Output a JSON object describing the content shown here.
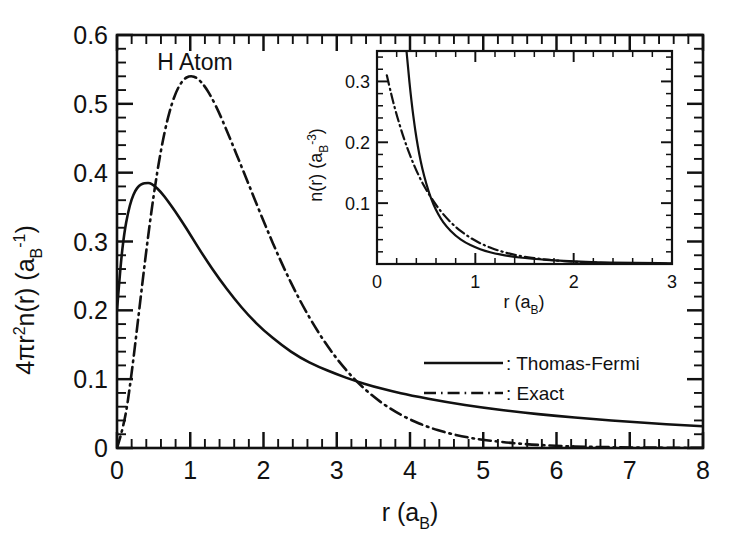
{
  "chart_data": [
    {
      "type": "line",
      "id": "main",
      "title": "",
      "annotation": "H Atom",
      "xlabel": "r  (a_B)",
      "xlabel_parts": {
        "symbol": "r",
        "open": "(a",
        "sub": "B",
        "close": ")"
      },
      "ylabel": "4πr²n(r)  (a_B⁻¹)",
      "ylabel_parts": {
        "main": "4πr",
        "exp1": "2",
        "mid": "n(r)",
        "open": "(a",
        "sub": "B",
        "sup": "-1",
        "close": ")"
      },
      "xlim": [
        0,
        8
      ],
      "ylim": [
        0,
        0.6
      ],
      "xticks": [
        0,
        1,
        2,
        3,
        4,
        5,
        6,
        7,
        8
      ],
      "xticklabels": [
        "0",
        "1",
        "2",
        "3",
        "4",
        "5",
        "6",
        "7",
        "8"
      ],
      "yticks": [
        0,
        0.1,
        0.2,
        0.3,
        0.4,
        0.5,
        0.6
      ],
      "yticklabels": [
        "0",
        "0.1",
        "0.2",
        "0.3",
        "0.4",
        "0.5",
        "0.6"
      ],
      "x_minor_per_major": 5,
      "y_minor_per_major": 5,
      "grid": false,
      "legend_position": "center-right-inside",
      "series": [
        {
          "name": "Thomas-Fermi",
          "style": "solid",
          "legend_label": ": Thomas-Fermi",
          "x": [
            0.0,
            0.05,
            0.1,
            0.15,
            0.2,
            0.25,
            0.3,
            0.35,
            0.4,
            0.45,
            0.5,
            0.6,
            0.7,
            0.8,
            0.9,
            1.0,
            1.2,
            1.4,
            1.6,
            1.8,
            2.0,
            2.25,
            2.5,
            2.75,
            3.0,
            3.25,
            3.5,
            3.75,
            4.0,
            4.5,
            5.0,
            5.5,
            6.0,
            6.5,
            7.0,
            7.5,
            8.0
          ],
          "y": [
            0.2,
            0.268,
            0.313,
            0.342,
            0.362,
            0.374,
            0.381,
            0.384,
            0.385,
            0.385,
            0.382,
            0.372,
            0.358,
            0.343,
            0.327,
            0.31,
            0.276,
            0.245,
            0.217,
            0.192,
            0.171,
            0.149,
            0.131,
            0.118,
            0.107,
            0.0975,
            0.0895,
            0.0825,
            0.0765,
            0.0665,
            0.0585,
            0.052,
            0.0465,
            0.042,
            0.038,
            0.0345,
            0.0315
          ]
        },
        {
          "name": "Exact",
          "style": "dashdot",
          "legend_label": ": Exact",
          "x": [
            0.0,
            0.1,
            0.2,
            0.3,
            0.4,
            0.5,
            0.6,
            0.7,
            0.8,
            0.9,
            1.0,
            1.1,
            1.2,
            1.3,
            1.4,
            1.5,
            1.75,
            2.0,
            2.25,
            2.5,
            2.75,
            3.0,
            3.25,
            3.5,
            3.75,
            4.0,
            4.25,
            4.5,
            4.75,
            5.0,
            5.5,
            6.0,
            6.5,
            7.0,
            7.5,
            8.0
          ],
          "y": [
            0.0,
            0.0328,
            0.1073,
            0.1976,
            0.2875,
            0.3679,
            0.4338,
            0.4834,
            0.5167,
            0.5352,
            0.5413,
            0.5375,
            0.5255,
            0.5077,
            0.4857,
            0.4609,
            0.3958,
            0.3293,
            0.2674,
            0.2131,
            0.1671,
            0.1291,
            0.0985,
            0.0743,
            0.0555,
            0.0411,
            0.0302,
            0.022,
            0.016,
            0.0116,
            0.006,
            0.003,
            0.0015,
            0.0008,
            0.0004,
            0.0002
          ]
        }
      ]
    },
    {
      "type": "line",
      "id": "inset",
      "title": "",
      "xlabel": "r  (a_B)",
      "xlabel_parts": {
        "symbol": "r",
        "open": "(a",
        "sub": "B",
        "close": ")"
      },
      "ylabel": "n(r)  (a_B⁻³)",
      "ylabel_parts": {
        "main": "n(r)",
        "open": "(a",
        "sub": "B",
        "sup": "-3",
        "close": ")"
      },
      "xlim": [
        0,
        3
      ],
      "ylim": [
        0,
        0.35
      ],
      "xticks": [
        0,
        1,
        2,
        3
      ],
      "xticklabels": [
        "0",
        "1",
        "2",
        "3"
      ],
      "yticks": [
        0.1,
        0.2,
        0.3
      ],
      "yticklabels": [
        "0.1",
        "0.2",
        "0.3"
      ],
      "x_minor_per_major": 5,
      "y_minor_per_major": 5,
      "grid": false,
      "series": [
        {
          "name": "Thomas-Fermi",
          "style": "solid",
          "x": [
            0.3,
            0.32,
            0.34,
            0.36,
            0.38,
            0.4,
            0.43,
            0.46,
            0.5,
            0.55,
            0.6,
            0.65,
            0.7,
            0.8,
            0.9,
            1.0,
            1.1,
            1.2,
            1.3,
            1.4,
            1.5,
            1.65,
            1.8,
            2.0,
            2.25,
            2.5,
            2.75,
            3.0
          ],
          "y": [
            0.35,
            0.315,
            0.283,
            0.255,
            0.23,
            0.208,
            0.18,
            0.157,
            0.132,
            0.107,
            0.0885,
            0.074,
            0.0625,
            0.046,
            0.035,
            0.0272,
            0.0215,
            0.0173,
            0.0141,
            0.0116,
            0.0097,
            0.0075,
            0.0059,
            0.0043,
            0.0029,
            0.0021,
            0.0015,
            0.0011
          ]
        },
        {
          "name": "Exact",
          "style": "dashdot",
          "x": [
            0.1,
            0.15,
            0.2,
            0.25,
            0.3,
            0.35,
            0.4,
            0.45,
            0.5,
            0.6,
            0.7,
            0.8,
            0.9,
            1.0,
            1.1,
            1.2,
            1.3,
            1.4,
            1.5,
            1.65,
            1.8,
            2.0,
            2.25,
            2.5,
            2.75,
            3.0
          ],
          "y": [
            0.31,
            0.275,
            0.245,
            0.218,
            0.194,
            0.1727,
            0.1537,
            0.1368,
            0.1218,
            0.0965,
            0.0765,
            0.0606,
            0.0481,
            0.0381,
            0.0302,
            0.0239,
            0.019,
            0.015,
            0.0119,
            0.0084,
            0.0059,
            0.0036,
            0.0019,
            0.001,
            0.0005,
            0.0003
          ]
        }
      ]
    }
  ],
  "annotations": {
    "h_atom": "H Atom"
  },
  "legend": {
    "items": [
      {
        "label": ": Thomas-Fermi",
        "style": "solid"
      },
      {
        "label": ": Exact",
        "style": "dashdot"
      }
    ]
  },
  "colors": {
    "ink": "#111111",
    "background": "#ffffff"
  }
}
